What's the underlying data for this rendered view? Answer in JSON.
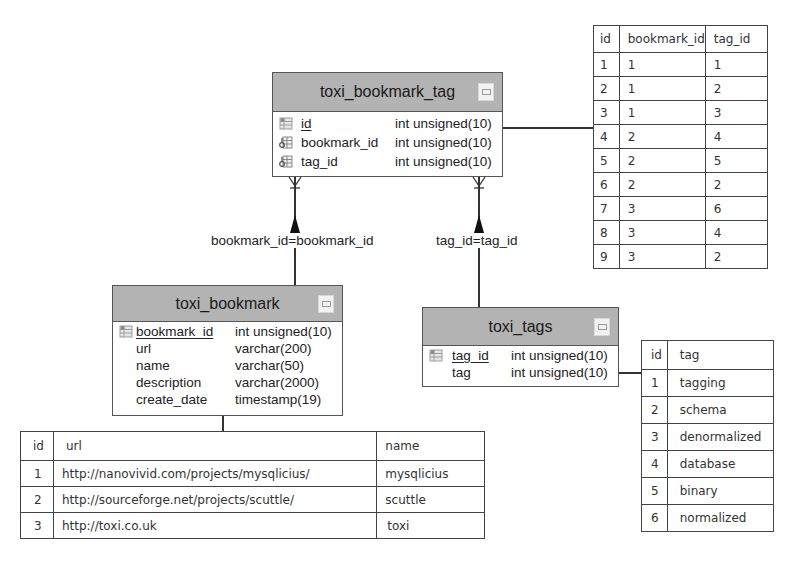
{
  "entities": {
    "bookmark_tag": {
      "title": "toxi_bookmark_tag",
      "fields": [
        {
          "name": "id",
          "type": "int unsigned(10)",
          "pk": true,
          "icon": "primary-key-icon"
        },
        {
          "name": "bookmark_id",
          "type": "int unsigned(10)",
          "pk": false,
          "icon": "foreign-key-icon"
        },
        {
          "name": "tag_id",
          "type": "int unsigned(10)",
          "pk": false,
          "icon": "foreign-key-icon"
        }
      ]
    },
    "bookmark": {
      "title": "toxi_bookmark",
      "fields": [
        {
          "name": "bookmark_id",
          "type": "int unsigned(10)",
          "pk": true,
          "icon": "primary-key-icon"
        },
        {
          "name": "url",
          "type": "varchar(200)",
          "pk": false
        },
        {
          "name": "name",
          "type": "varchar(50)",
          "pk": false
        },
        {
          "name": "description",
          "type": "varchar(2000)",
          "pk": false
        },
        {
          "name": "create_date",
          "type": "timestamp(19)",
          "pk": false
        }
      ]
    },
    "tags": {
      "title": "toxi_tags",
      "fields": [
        {
          "name": "tag_id",
          "type": "int unsigned(10)",
          "pk": true,
          "icon": "primary-key-icon"
        },
        {
          "name": "tag",
          "type": "int unsigned(10)",
          "pk": false
        }
      ]
    }
  },
  "relationships": {
    "bookmark": {
      "label": "bookmark_id=bookmark_id"
    },
    "tag": {
      "label": "tag_id=tag_id"
    }
  },
  "tables": {
    "bookmark_tag_data": {
      "headers": [
        "id",
        "bookmark_id",
        "tag_id"
      ],
      "rows": [
        [
          "1",
          "1",
          "1"
        ],
        [
          "2",
          "1",
          "2"
        ],
        [
          "3",
          "1",
          "3"
        ],
        [
          "4",
          "2",
          "4"
        ],
        [
          "5",
          "2",
          "5"
        ],
        [
          "6",
          "2",
          "2"
        ],
        [
          "7",
          "3",
          "6"
        ],
        [
          "8",
          "3",
          "4"
        ],
        [
          "9",
          "3",
          "2"
        ]
      ]
    },
    "bookmark_data": {
      "headers": [
        "id",
        "url",
        "name"
      ],
      "rows": [
        [
          "1",
          "http://nanovivid.com/projects/mysqlicius/",
          "mysqlicius"
        ],
        [
          "2",
          "http://sourceforge.net/projects/scuttle/",
          "scuttle"
        ],
        [
          "3",
          "http://toxi.co.uk",
          "toxi"
        ]
      ]
    },
    "tags_data": {
      "headers": [
        "id",
        "tag"
      ],
      "rows": [
        [
          "1",
          "tagging"
        ],
        [
          "2",
          "schema"
        ],
        [
          "3",
          "denormalized"
        ],
        [
          "4",
          "database"
        ],
        [
          "5",
          "binary"
        ],
        [
          "6",
          "normalized"
        ]
      ]
    }
  }
}
